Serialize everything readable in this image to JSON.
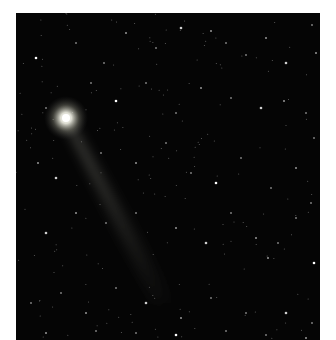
{
  "image": {
    "subject": "comet with tail in starfield",
    "background_color": "#050505",
    "frame_color": "#ffffff",
    "comet": {
      "head": {
        "x": 50,
        "y": 105,
        "radius": 5
      },
      "tail_end": {
        "x": 150,
        "y": 280
      }
    },
    "stars": [
      [
        20,
        45
      ],
      [
        60,
        30
      ],
      [
        88,
        50
      ],
      [
        110,
        20
      ],
      [
        140,
        35
      ],
      [
        165,
        15
      ],
      [
        195,
        18
      ],
      [
        210,
        30
      ],
      [
        230,
        42
      ],
      [
        250,
        25
      ],
      [
        270,
        50
      ],
      [
        296,
        12
      ],
      [
        300,
        40
      ],
      [
        30,
        95
      ],
      [
        75,
        70
      ],
      [
        100,
        88
      ],
      [
        130,
        70
      ],
      [
        160,
        100
      ],
      [
        185,
        75
      ],
      [
        215,
        85
      ],
      [
        245,
        95
      ],
      [
        268,
        88
      ],
      [
        290,
        100
      ],
      [
        298,
        125
      ],
      [
        22,
        150
      ],
      [
        40,
        165
      ],
      [
        85,
        140
      ],
      [
        120,
        150
      ],
      [
        150,
        130
      ],
      [
        175,
        160
      ],
      [
        200,
        170
      ],
      [
        225,
        145
      ],
      [
        255,
        175
      ],
      [
        280,
        155
      ],
      [
        295,
        190
      ],
      [
        30,
        220
      ],
      [
        60,
        200
      ],
      [
        90,
        210
      ],
      [
        120,
        200
      ],
      [
        160,
        215
      ],
      [
        190,
        230
      ],
      [
        215,
        200
      ],
      [
        240,
        225
      ],
      [
        262,
        230
      ],
      [
        280,
        205
      ],
      [
        298,
        250
      ],
      [
        15,
        290
      ],
      [
        45,
        280
      ],
      [
        70,
        300
      ],
      [
        100,
        275
      ],
      [
        130,
        290
      ],
      [
        165,
        305
      ],
      [
        195,
        285
      ],
      [
        230,
        300
      ],
      [
        252,
        245
      ],
      [
        270,
        300
      ],
      [
        296,
        310
      ],
      [
        30,
        320
      ],
      [
        80,
        318
      ],
      [
        120,
        320
      ],
      [
        160,
        322
      ],
      [
        210,
        318
      ],
      [
        250,
        322
      ],
      [
        290,
        325
      ]
    ]
  }
}
